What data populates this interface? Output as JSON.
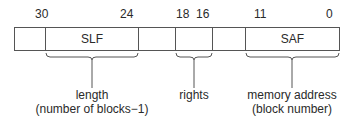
{
  "diagram": {
    "bit_numbers": [
      {
        "value": "30",
        "x": 35
      },
      {
        "value": "24",
        "x": 120
      },
      {
        "value": "18",
        "x": 176
      },
      {
        "value": "16",
        "x": 196
      },
      {
        "value": "11",
        "x": 254
      },
      {
        "value": "0",
        "x": 326
      }
    ],
    "fields": [
      {
        "label": "",
        "x": 14,
        "w": 32
      },
      {
        "label": "SLF",
        "x": 45,
        "w": 94
      },
      {
        "label": "",
        "x": 138,
        "w": 38
      },
      {
        "label": "",
        "x": 175,
        "w": 38
      },
      {
        "label": "",
        "x": 212,
        "w": 34
      },
      {
        "label": "SAF",
        "x": 245,
        "w": 95
      }
    ],
    "annotations": {
      "length": {
        "line1": "length",
        "line2": "(number of blocks−1)"
      },
      "rights": {
        "line1": "rights"
      },
      "memory_address": {
        "line1": "memory address",
        "line2": "(block number)"
      }
    },
    "colors": {
      "line": "#555555",
      "text": "#2a2a2a"
    }
  }
}
